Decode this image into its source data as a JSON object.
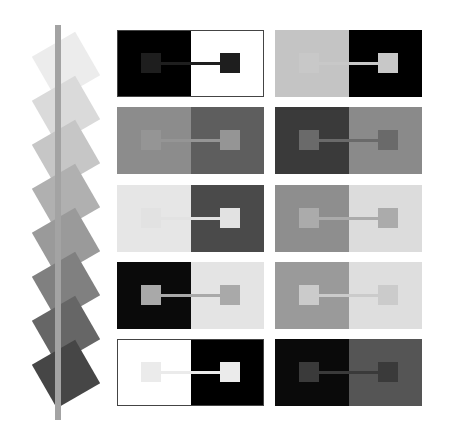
{
  "strip": {
    "bar_color": "#a3a3a3",
    "tiles": [
      {
        "color": "#ececec",
        "cx": 66,
        "cy": 66
      },
      {
        "color": "#dadada",
        "cx": 66,
        "cy": 110
      },
      {
        "color": "#c6c6c6",
        "cx": 66,
        "cy": 154
      },
      {
        "color": "#b0b0b0",
        "cx": 66,
        "cy": 198
      },
      {
        "color": "#9a9a9a",
        "cx": 66,
        "cy": 242
      },
      {
        "color": "#808080",
        "cx": 66,
        "cy": 286
      },
      {
        "color": "#666666",
        "cx": 66,
        "cy": 330
      },
      {
        "color": "#464646",
        "cx": 66,
        "cy": 374
      }
    ]
  },
  "panels": [
    {
      "x": 117,
      "y": 30,
      "left_bg": "#000000",
      "right_bg": "#ffffff",
      "square": "#1e1e1e",
      "outline": true
    },
    {
      "x": 275,
      "y": 30,
      "left_bg": "#c4c4c4",
      "right_bg": "#000000",
      "square": "#c8c8c8",
      "outline": false
    },
    {
      "x": 117,
      "y": 107,
      "left_bg": "#8c8c8c",
      "right_bg": "#5e5e5e",
      "square": "#959595",
      "outline": false
    },
    {
      "x": 275,
      "y": 107,
      "left_bg": "#3a3a3a",
      "right_bg": "#8a8a8a",
      "square": "#6a6a6a",
      "outline": false
    },
    {
      "x": 117,
      "y": 185,
      "left_bg": "#e6e6e6",
      "right_bg": "#4a4a4a",
      "square": "#e2e2e2",
      "outline": false
    },
    {
      "x": 275,
      "y": 185,
      "left_bg": "#8e8e8e",
      "right_bg": "#dcdcdc",
      "square": "#ababab",
      "outline": false
    },
    {
      "x": 117,
      "y": 262,
      "left_bg": "#0a0a0a",
      "right_bg": "#e4e4e4",
      "square": "#a9a9a9",
      "outline": false
    },
    {
      "x": 275,
      "y": 262,
      "left_bg": "#9a9a9a",
      "right_bg": "#dedede",
      "square": "#cbcbcb",
      "outline": false
    },
    {
      "x": 117,
      "y": 339,
      "left_bg": "#ffffff",
      "right_bg": "#000000",
      "square": "#ebebeb",
      "outline": true
    },
    {
      "x": 275,
      "y": 339,
      "left_bg": "#0a0a0a",
      "right_bg": "#555555",
      "square": "#3a3a3a",
      "outline": false
    }
  ]
}
